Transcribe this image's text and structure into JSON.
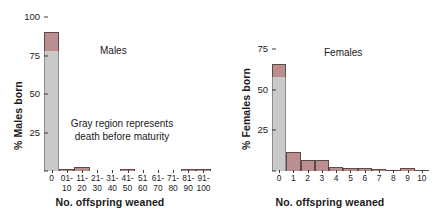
{
  "figure": {
    "xlabel": "No. offspring weaned",
    "annotation": "Gray region represents\ndeath before maturity"
  },
  "colors": {
    "survived_pink": "#bb8f8f",
    "died_gray": "#c9c9c9",
    "axis": "#3a3a3a",
    "text": "#1a1a1a"
  },
  "chart_data": [
    {
      "type": "bar",
      "id": "males",
      "title": "Males",
      "xlabel": "No. offspring weaned",
      "ylabel": "% Males born",
      "ylim": [
        0,
        100
      ],
      "yticks": [
        0,
        25,
        50,
        75,
        100
      ],
      "ytick_labels": [
        "",
        "25",
        "50",
        "75",
        "100"
      ],
      "grid": false,
      "legend": "none",
      "stacked": true,
      "annotation": "Gray region represents\ndeath before maturity",
      "categories": [
        "0",
        "01-\n10",
        "11-\n20",
        "21-\n30",
        "31-\n40",
        "41-\n50",
        "51\n60",
        "61-\n70",
        "71-\n80",
        "81-\n90",
        "91-\n100"
      ],
      "series": [
        {
          "name": "died before maturity (gray)",
          "values": [
            78.0,
            0.0,
            0.0,
            0.0,
            0.0,
            0.0,
            0.0,
            0.0,
            0.0,
            0.0,
            0.0
          ]
        },
        {
          "name": "survived (pink)",
          "values": [
            12.0,
            1.2,
            2.4,
            0.0,
            0.0,
            1.2,
            0.0,
            0.0,
            0.0,
            1.2,
            1.2
          ]
        }
      ],
      "totals": [
        90.0,
        1.2,
        2.4,
        0.0,
        0.0,
        1.2,
        0.0,
        0.0,
        0.0,
        1.2,
        1.2
      ]
    },
    {
      "type": "bar",
      "id": "females",
      "title": "Females",
      "xlabel": "No. offspring weaned",
      "ylabel": "% Females born",
      "ylim": [
        0,
        75
      ],
      "yticks": [
        0,
        25,
        50,
        75
      ],
      "ytick_labels": [
        "",
        "25",
        "50",
        "75"
      ],
      "grid": false,
      "legend": "none",
      "stacked": true,
      "categories": [
        "0",
        "1",
        "2",
        "3",
        "4",
        "5",
        "6",
        "7",
        "8",
        "9",
        "10"
      ],
      "series": [
        {
          "name": "died before maturity (gray)",
          "values": [
            58.0,
            0.0,
            0.0,
            0.0,
            0.0,
            0.0,
            0.0,
            0.0,
            0.0,
            0.0,
            0.0
          ]
        },
        {
          "name": "survived (pink)",
          "values": [
            8.0,
            11.5,
            7.0,
            6.5,
            2.5,
            2.0,
            1.6,
            1.4,
            0.5,
            1.8,
            0.4
          ]
        }
      ],
      "totals": [
        66.0,
        11.5,
        7.0,
        6.5,
        2.5,
        2.0,
        1.6,
        1.4,
        0.5,
        1.8,
        0.4
      ]
    }
  ]
}
